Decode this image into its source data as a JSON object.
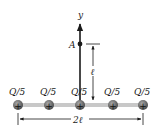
{
  "diagram": {
    "axis_label": "y",
    "point_label": "A",
    "distance_label": "ℓ",
    "width_label": "2ℓ",
    "charges": [
      {
        "label": "Q/5",
        "sign": "+"
      },
      {
        "label": "Q/5",
        "sign": "+"
      },
      {
        "label": "Q/5",
        "sign": "+"
      },
      {
        "label": "Q/5",
        "sign": "+"
      },
      {
        "label": "Q/5",
        "sign": "+"
      }
    ],
    "colors": {
      "rod": "#c8c8c8",
      "charge_fill": "#6e6e6e",
      "line": "#1a1a1a"
    }
  }
}
